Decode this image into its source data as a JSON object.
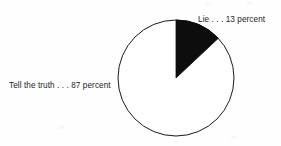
{
  "figure": {
    "background_color": "#fefefe",
    "line_color": "#1a1a1a",
    "slice_fill_dark": "#0d0d0d",
    "slice_fill_light": "#ffffff",
    "text_color": "#1d1d1d"
  },
  "labels": {
    "lie": "Lie . . . 13 percent",
    "truth": "Tell the truth . . . 87 percent"
  },
  "chart_data": {
    "type": "pie",
    "title": "",
    "subtitle": "",
    "xlabel": "",
    "ylabel": "",
    "categories": [
      "Lie",
      "Tell the truth"
    ],
    "values": [
      13,
      87
    ],
    "value_unit": "percent",
    "labels": [
      "Lie . . . 13 percent",
      "Tell the truth . . . 87 percent"
    ],
    "colors": [
      "#0d0d0d",
      "#ffffff"
    ],
    "start_angle_deg": 0,
    "direction": "clockwise",
    "legend": "none",
    "grid": false,
    "annotations": [
      {
        "text": "Lie . . . 13 percent",
        "position": "top-right",
        "points_to": "Lie"
      },
      {
        "text": "Tell the truth . . . 87 percent",
        "position": "left",
        "points_to": "Tell the truth"
      }
    ],
    "geometry": {
      "center_x": 176,
      "center_y": 78,
      "radius": 58,
      "stroke_width": 1
    }
  }
}
